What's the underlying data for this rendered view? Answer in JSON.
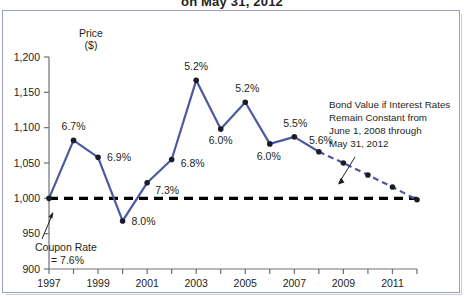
{
  "figure": {
    "clipped_title": "on May 31, 2012",
    "frame_color": "#9a9ec4",
    "background": "#ffffff"
  },
  "colors": {
    "series_line": "#4b5a9e",
    "point_marker": "#1b1b2a",
    "coupon_line": "#000000",
    "text": "#231f20",
    "axis": "#6e6e78"
  },
  "chart_data": {
    "type": "line",
    "title": "on May 31, 2012",
    "xlabel": "",
    "ylabel": "Price ($)",
    "ylabel_line1": "Price",
    "ylabel_line2": "($)",
    "xlim": [
      1997,
      2012
    ],
    "ylim": [
      900,
      1200
    ],
    "ytick_values": [
      1200,
      1150,
      1100,
      1050,
      1000,
      950,
      900
    ],
    "ytick_labels": [
      "1,200",
      "1,150",
      "1,100",
      "1,050",
      "1,000",
      "950",
      "900"
    ],
    "xtick_values": [
      1997,
      1998,
      1999,
      2000,
      2001,
      2002,
      2003,
      2004,
      2005,
      2006,
      2007,
      2008,
      2009,
      2010,
      2011,
      2012
    ],
    "xtick_labels_shown": [
      "1997",
      "1999",
      "2001",
      "2003",
      "2005",
      "2007",
      "2009",
      "2011"
    ],
    "xtick_labeled_values": [
      1997,
      1999,
      2001,
      2003,
      2005,
      2007,
      2009,
      2011
    ],
    "grid": false,
    "legend": null,
    "series": [
      {
        "name": "Bond Value (actual)",
        "style": "solid",
        "color": "#4b5a9e",
        "x": [
          1997,
          1998,
          1999,
          2000,
          2001,
          2002,
          2003,
          2004,
          2005,
          2006,
          2007,
          2008
        ],
        "values": [
          1000,
          1082,
          1058,
          968,
          1022,
          1055,
          1167,
          1098,
          1136,
          1077,
          1087,
          1066
        ],
        "point_labels": [
          "",
          "6.7%",
          "6.9%",
          "8.0%",
          "7.3%",
          "6.8%",
          "5.2%",
          "6.0%",
          "5.2%",
          "6.0%",
          "5.5%",
          "5.6%"
        ]
      },
      {
        "name": "Bond Value if Interest Rates Remain Constant",
        "style": "dashed",
        "color": "#4b5a9e",
        "x": [
          2008,
          2009,
          2010,
          2011,
          2012
        ],
        "values": [
          1066,
          1050,
          1033,
          1016,
          998
        ],
        "point_labels": [
          "",
          "",
          "",
          "",
          ""
        ]
      },
      {
        "name": "Coupon Rate = 7.6% (par line)",
        "style": "heavy-dashed",
        "color": "#000000",
        "x": [
          1997,
          2012
        ],
        "values": [
          1000,
          1000
        ],
        "point_labels": [
          "",
          ""
        ]
      }
    ],
    "annotations": [
      {
        "id": "coupon-rate",
        "lines": [
          "Coupon Rate",
          "= 7.6%"
        ],
        "text": "Coupon Rate = 7.6%",
        "points_to": {
          "x": 1997,
          "y": 1000
        }
      },
      {
        "id": "projection-note",
        "lines": [
          "Bond Value if Interest Rates",
          "Remain Constant from",
          "June 1, 2008 through",
          "May 31, 2012"
        ],
        "text": "Bond Value if Interest Rates Remain Constant from June 1, 2008 through May 31, 2012",
        "points_to": {
          "x": 2010,
          "y": 1033
        }
      }
    ]
  }
}
